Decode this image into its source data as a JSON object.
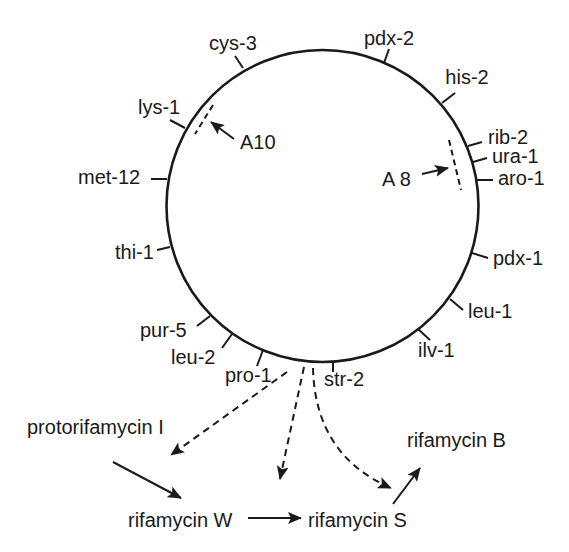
{
  "genetic_map": {
    "loci": [
      "cys-3",
      "pdx-2",
      "his-2",
      "rib-2",
      "ura-1",
      "aro-1",
      "pdx-1",
      "leu-1",
      "ilv-1",
      "str-2",
      "pro-1",
      "leu-2",
      "pur-5",
      "thi-1",
      "met-12",
      "lys-1"
    ],
    "regions": [
      "A10",
      "A 8"
    ]
  },
  "pathway": {
    "compounds": [
      "protorifamycin I",
      "rifamycin W",
      "rifamycin S",
      "rifamycin B"
    ],
    "steps": [
      {
        "from": "protorifamycin I",
        "to": "rifamycin W",
        "style": "solid"
      },
      {
        "from": "rifamycin W",
        "to": "rifamycin S",
        "style": "solid"
      },
      {
        "from": "rifamycin S",
        "to": "rifamycin B",
        "style": "solid"
      }
    ]
  },
  "colors": {
    "ink": "#1a1a1a",
    "background": "#ffffff"
  }
}
